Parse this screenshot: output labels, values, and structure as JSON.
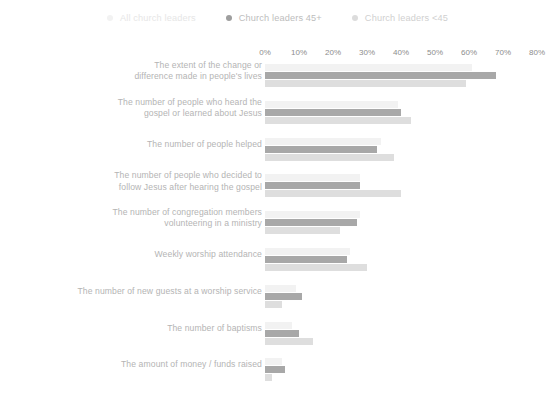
{
  "legend": {
    "items": [
      {
        "label": "All church leaders",
        "color": "#f2f2f2",
        "marker": "legend-dot-all"
      },
      {
        "label": "Church leaders 45+",
        "color": "#a8a8a8",
        "marker": "legend-dot-45plus"
      },
      {
        "label": "Church leaders <45",
        "color": "#dedede",
        "marker": "legend-dot-under45"
      }
    ]
  },
  "axis": {
    "ticks": [
      "0%",
      "10%",
      "20%",
      "30%",
      "40%",
      "50%",
      "60%",
      "70%",
      "80%"
    ]
  },
  "chart_data": {
    "type": "bar",
    "orientation": "horizontal",
    "title": "",
    "subtitle": "",
    "xlabel": "",
    "ylabel": "",
    "xlim": [
      0,
      80
    ],
    "xticks": [
      0,
      10,
      20,
      30,
      40,
      50,
      60,
      70,
      80
    ],
    "xtick_labels": [
      "0%",
      "10%",
      "20%",
      "30%",
      "40%",
      "50%",
      "60%",
      "70%",
      "80%"
    ],
    "grid": false,
    "legend_position": "top-center",
    "categories": [
      "The extent of the change or difference made in people's lives",
      "The number of people who heard the gospel or learned about Jesus",
      "The number of people helped",
      "The number of people who decided to follow Jesus after hearing the gospel",
      "The number of congregation members volunteering in a ministry",
      "Weekly worship attendance",
      "The number of new guests at a worship service",
      "The number of  baptisms",
      "The amount of money / funds raised"
    ],
    "category_lines": [
      [
        "The extent of the change or",
        "difference made in people's lives"
      ],
      [
        "The number of people who heard the",
        "gospel or learned about Jesus"
      ],
      [
        "The number of people helped"
      ],
      [
        "The number of people who decided to",
        "follow Jesus after hearing the gospel"
      ],
      [
        "The number of congregation members",
        "volunteering in a ministry"
      ],
      [
        "Weekly worship attendance"
      ],
      [
        "The number of new guests at a worship service"
      ],
      [
        "The number of  baptisms"
      ],
      [
        "The amount of money / funds raised"
      ]
    ],
    "series": [
      {
        "name": "All church leaders",
        "color": "#f2f2f2",
        "values": [
          61,
          39,
          34,
          28,
          28,
          25,
          9,
          8,
          5
        ]
      },
      {
        "name": "Church leaders 45+",
        "color": "#a8a8a8",
        "values": [
          68,
          40,
          33,
          28,
          27,
          24,
          11,
          10,
          6
        ]
      },
      {
        "name": "Church leaders <45",
        "color": "#dedede",
        "values": [
          59,
          43,
          38,
          40,
          22,
          30,
          5,
          14,
          2
        ]
      }
    ]
  }
}
